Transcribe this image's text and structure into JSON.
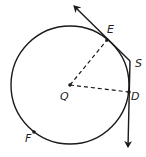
{
  "diagram": {
    "type": "circle-tangent-geometry",
    "circle": {
      "center_label": "Q",
      "cx": 70,
      "cy": 85,
      "r": 59
    },
    "points": [
      {
        "label": "Q",
        "x": 70,
        "y": 85,
        "label_x": 60,
        "label_y": 100
      },
      {
        "label": "E",
        "x": 107,
        "y": 40,
        "label_x": 107,
        "label_y": 33
      },
      {
        "label": "S",
        "x": 130,
        "y": 61,
        "label_x": 135,
        "label_y": 67
      },
      {
        "label": "D",
        "x": 129,
        "y": 92,
        "label_x": 131,
        "label_y": 100
      },
      {
        "label": "F",
        "x": 34,
        "y": 132,
        "label_x": 25,
        "label_y": 142
      }
    ],
    "segments": [
      {
        "name": "radius-QE",
        "from": "Q",
        "to": "E",
        "style": "dashed"
      },
      {
        "name": "radius-QD",
        "from": "Q",
        "to": "D",
        "style": "dashed"
      }
    ],
    "rays": [
      {
        "name": "tangent-ray-SE",
        "from": "S",
        "through": "E",
        "end_x": 73,
        "end_y": 5
      },
      {
        "name": "tangent-ray-SD",
        "from": "S",
        "through": "D",
        "end_x": 128,
        "end_y": 148
      }
    ],
    "colors": {
      "stroke": "#1a1a1a",
      "background": "#ffffff"
    }
  }
}
